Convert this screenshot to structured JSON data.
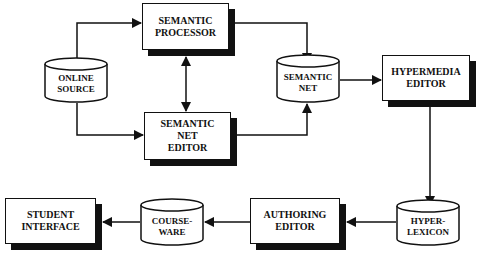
{
  "diagram": {
    "nodes": {
      "online_source": {
        "shape": "cylinder",
        "lines": [
          "ONLINE",
          "SOURCE"
        ]
      },
      "semantic_processor": {
        "shape": "box",
        "lines": [
          "SEMANTIC",
          "PROCESSOR"
        ]
      },
      "semantic_net_editor": {
        "shape": "box",
        "lines": [
          "SEMANTIC",
          "NET",
          "EDITOR"
        ]
      },
      "semantic_net": {
        "shape": "cylinder",
        "lines": [
          "SEMANTIC",
          "NET"
        ]
      },
      "hypermedia_editor": {
        "shape": "box",
        "lines": [
          "HYPERMEDIA",
          "EDITOR"
        ]
      },
      "hyper_lexicon": {
        "shape": "cylinder",
        "lines": [
          "HYPER-",
          "LEXICON"
        ]
      },
      "authoring_editor": {
        "shape": "box",
        "lines": [
          "AUTHORING",
          "EDITOR"
        ]
      },
      "courseware": {
        "shape": "cylinder",
        "lines": [
          "COURSE-",
          "WARE"
        ]
      },
      "student_interface": {
        "shape": "box",
        "lines": [
          "STUDENT",
          "INTERFACE"
        ]
      }
    },
    "edges": [
      {
        "from": "online_source",
        "to": "semantic_processor"
      },
      {
        "from": "online_source",
        "to": "semantic_net_editor"
      },
      {
        "from": "semantic_processor",
        "to": "semantic_net_editor",
        "bidirectional": true
      },
      {
        "from": "semantic_processor",
        "to": "semantic_net"
      },
      {
        "from": "semantic_net_editor",
        "to": "semantic_net"
      },
      {
        "from": "semantic_net",
        "to": "hypermedia_editor"
      },
      {
        "from": "hypermedia_editor",
        "to": "hyper_lexicon"
      },
      {
        "from": "hyper_lexicon",
        "to": "authoring_editor"
      },
      {
        "from": "authoring_editor",
        "to": "courseware"
      },
      {
        "from": "courseware",
        "to": "student_interface"
      }
    ]
  }
}
